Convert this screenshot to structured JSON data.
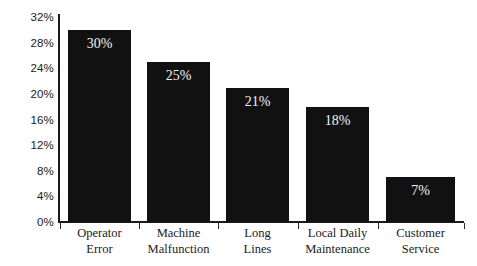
{
  "chart_data": {
    "type": "bar",
    "title": "",
    "subtitle": "",
    "xlabel": "",
    "ylabel": "",
    "ylim": [
      0,
      32
    ],
    "grid": false,
    "legend": "none",
    "categories": [
      "Operator Error",
      "Machine Malfunction",
      "Long Lines",
      "Local Daily Maintenance",
      "Customer Service"
    ],
    "category_lines": [
      [
        "Operator",
        "Error"
      ],
      [
        "Machine",
        "Malfunction"
      ],
      [
        "Long",
        "Lines"
      ],
      [
        "Local Daily",
        "Maintenance"
      ],
      [
        "Customer",
        "Service"
      ]
    ],
    "values": [
      30,
      25,
      21,
      18,
      7
    ],
    "data_labels": [
      "30%",
      "25%",
      "21%",
      "18%",
      "7%"
    ],
    "ytick_labels": [
      "32%",
      "28%",
      "24%",
      "20%",
      "16%",
      "12%",
      "8%",
      "4%",
      "0%"
    ],
    "ytick_values": [
      32,
      28,
      24,
      20,
      16,
      12,
      8,
      4,
      0
    ],
    "colors": {
      "bar_fill": "#111111",
      "axis": "#1b1b1b",
      "background": "#ffffff",
      "data_label_text": "#f4f4f4",
      "tick_label_text": "#1a1a1a"
    }
  }
}
